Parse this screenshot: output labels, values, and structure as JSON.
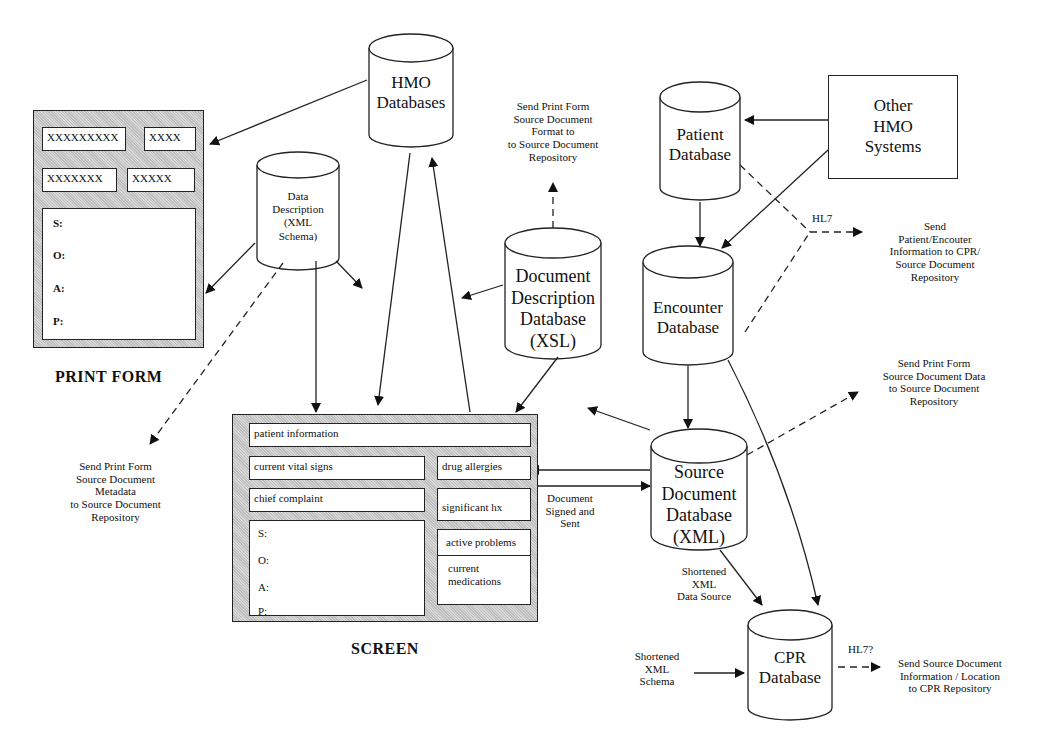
{
  "print_form": {
    "caption": "PRINT FORM",
    "fields": [
      "XXXXXXXXX",
      "XXXX",
      "XXXXXXX",
      "XXXXX"
    ],
    "soap": [
      "S:",
      "O:",
      "A:",
      "P:"
    ]
  },
  "screen": {
    "caption": "SCREEN",
    "patient_information": "patient information",
    "current_vital_signs": "current vital signs",
    "chief_complaint": "chief complaint",
    "drug_allergies": "drug allergies",
    "significant_hx": "significant hx",
    "active_problems": "active problems",
    "current_medications": "current medications",
    "soap": [
      "S:",
      "O:",
      "A:",
      "P:"
    ]
  },
  "databases": {
    "hmo": [
      "HMO",
      "Databases"
    ],
    "data_description": [
      "Data",
      "Description",
      "(XML",
      "Schema)"
    ],
    "document_description": [
      "Document",
      "Description",
      "Database",
      "(XSL)"
    ],
    "patient": [
      "Patient",
      "Database"
    ],
    "encounter": [
      "Encounter",
      "Database"
    ],
    "source_document": [
      "Source",
      "Document",
      "Database",
      "(XML)"
    ],
    "cpr": [
      "CPR",
      "Database"
    ]
  },
  "systems": {
    "other_hmo": [
      "Other",
      "HMO",
      "Systems"
    ]
  },
  "annotations": {
    "format_to_repository": [
      "Send Print Form",
      "Source Document",
      "Format to",
      "to Source Document",
      "Repository"
    ],
    "hl7": "HL7",
    "patient_encounter": [
      "Send",
      "Patient/Encouter",
      "Information to CPR/",
      "Source Document",
      "Repository"
    ],
    "data_to_repository": [
      "Send Print Form",
      "Source Document Data",
      "to Source Document",
      "Repository"
    ],
    "metadata_to_repository": [
      "Send Print Form",
      "Source Document",
      "Metadata",
      "to Source Document",
      "Repository"
    ],
    "signed_sent": [
      "Document",
      "Signed and",
      "Sent"
    ],
    "shortened_data_source": [
      "Shortened",
      "XML",
      "Data Source"
    ],
    "shortened_schema": [
      "Shortened",
      "XML",
      "Schema"
    ],
    "hl7_question": "HL7?",
    "cpr_repository": [
      "Send Source Document",
      "Information / Location",
      "to CPR Repository"
    ]
  }
}
